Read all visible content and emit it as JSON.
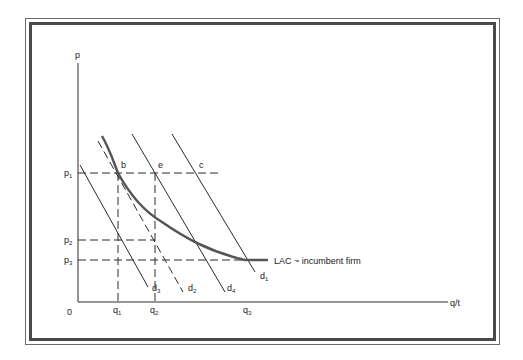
{
  "diagram": {
    "axes": {
      "y_label": "p",
      "x_label": "q/t",
      "origin_label": "0"
    },
    "price_levels": [
      {
        "main": "p",
        "sub": "1"
      },
      {
        "main": "p",
        "sub": "2"
      },
      {
        "main": "p",
        "sub": "3"
      }
    ],
    "quantity_levels": [
      {
        "main": "q",
        "sub": "1"
      },
      {
        "main": "q",
        "sub": "2"
      },
      {
        "main": "q",
        "sub": "3"
      }
    ],
    "points": {
      "b": "b",
      "e": "e",
      "c": "c"
    },
    "demand_curves": [
      {
        "main": "d",
        "sub": "1",
        "style": "solid"
      },
      {
        "main": "d",
        "sub": "2",
        "style": "dashed"
      },
      {
        "main": "d",
        "sub": "3",
        "style": "solid"
      },
      {
        "main": "d",
        "sub": "4",
        "style": "solid"
      }
    ],
    "cost_curve": {
      "label": "LAC ~ incumbent firm"
    },
    "colors": {
      "line": "#2a2a2a",
      "curve": "#555555",
      "frame": "#4a4a4a"
    }
  }
}
